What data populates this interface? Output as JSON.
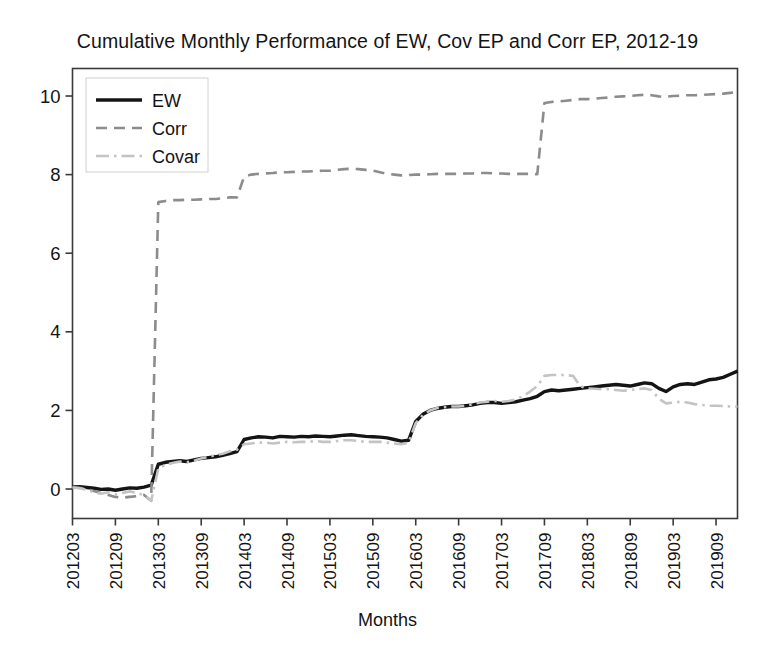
{
  "chart_data": {
    "type": "line",
    "title": "Cumulative Monthly Performance of EW, Cov EP and Corr EP, 2012-19",
    "xlabel": "Months",
    "ylabel": "",
    "grid": false,
    "legend_position": "top-left",
    "xlim": [
      0,
      93
    ],
    "ylim": [
      -0.75,
      10.7
    ],
    "yticks": [
      "0",
      "2",
      "4",
      "6",
      "8",
      "10"
    ],
    "ytick_values": [
      0,
      2,
      4,
      6,
      8,
      10
    ],
    "xticks": [
      "201203",
      "201209",
      "201303",
      "201309",
      "201403",
      "201409",
      "201503",
      "201509",
      "201603",
      "201609",
      "201703",
      "201709",
      "201803",
      "201809",
      "201903",
      "201909"
    ],
    "xtick_indices": [
      0,
      6,
      12,
      18,
      24,
      30,
      36,
      42,
      48,
      54,
      60,
      66,
      72,
      78,
      84,
      90
    ],
    "series": [
      {
        "name": "EW",
        "color": "#141414",
        "style": "solid",
        "values": [
          0.05,
          0.06,
          0.04,
          0.02,
          -0.01,
          0.0,
          -0.03,
          0.0,
          0.03,
          0.02,
          0.05,
          0.1,
          0.63,
          0.68,
          0.7,
          0.72,
          0.7,
          0.74,
          0.78,
          0.8,
          0.82,
          0.86,
          0.9,
          0.95,
          1.26,
          1.3,
          1.33,
          1.32,
          1.3,
          1.34,
          1.33,
          1.32,
          1.34,
          1.33,
          1.35,
          1.34,
          1.33,
          1.35,
          1.37,
          1.38,
          1.36,
          1.34,
          1.33,
          1.32,
          1.3,
          1.26,
          1.22,
          1.24,
          1.72,
          1.9,
          2.0,
          2.05,
          2.08,
          2.1,
          2.1,
          2.12,
          2.14,
          2.18,
          2.2,
          2.2,
          2.18,
          2.2,
          2.22,
          2.26,
          2.3,
          2.36,
          2.48,
          2.52,
          2.5,
          2.52,
          2.54,
          2.56,
          2.58,
          2.6,
          2.62,
          2.64,
          2.66,
          2.64,
          2.62,
          2.66,
          2.7,
          2.68,
          2.56,
          2.48,
          2.6,
          2.66,
          2.68,
          2.66,
          2.72,
          2.78,
          2.8,
          2.84,
          2.92,
          3.0
        ]
      },
      {
        "name": "Corr",
        "color": "#8c8c8c",
        "style": "dashed",
        "values": [
          0.05,
          0.03,
          0.0,
          -0.05,
          -0.1,
          -0.15,
          -0.2,
          -0.22,
          -0.2,
          -0.18,
          -0.15,
          -0.3,
          7.3,
          7.33,
          7.35,
          7.35,
          7.36,
          7.36,
          7.37,
          7.38,
          7.38,
          7.4,
          7.42,
          7.42,
          7.95,
          8.0,
          8.02,
          8.03,
          8.04,
          8.06,
          8.06,
          8.07,
          8.08,
          8.08,
          8.09,
          8.1,
          8.1,
          8.12,
          8.14,
          8.15,
          8.14,
          8.12,
          8.1,
          8.06,
          8.02,
          8.0,
          7.98,
          7.99,
          8.0,
          8.0,
          8.01,
          8.02,
          8.02,
          8.02,
          8.02,
          8.03,
          8.03,
          8.04,
          8.04,
          8.03,
          8.03,
          8.02,
          8.02,
          8.02,
          8.02,
          8.01,
          9.82,
          9.85,
          9.86,
          9.88,
          9.9,
          9.92,
          9.92,
          9.93,
          9.95,
          9.96,
          9.98,
          9.99,
          10.0,
          10.02,
          10.03,
          10.02,
          9.99,
          9.98,
          10.0,
          10.01,
          10.02,
          10.02,
          10.03,
          10.04,
          10.05,
          10.06,
          10.08,
          10.1
        ]
      },
      {
        "name": "Covar",
        "color": "#c4c4c4",
        "style": "dashdot",
        "values": [
          0.04,
          0.02,
          -0.02,
          -0.08,
          -0.12,
          -0.08,
          -0.14,
          -0.1,
          -0.06,
          -0.1,
          -0.16,
          -0.3,
          0.52,
          0.62,
          0.66,
          0.7,
          0.68,
          0.72,
          0.78,
          0.82,
          0.86,
          0.9,
          0.96,
          1.0,
          1.14,
          1.16,
          1.18,
          1.18,
          1.16,
          1.18,
          1.2,
          1.19,
          1.2,
          1.2,
          1.22,
          1.2,
          1.2,
          1.22,
          1.24,
          1.24,
          1.22,
          1.2,
          1.2,
          1.2,
          1.18,
          1.16,
          1.14,
          1.18,
          1.68,
          1.88,
          2.0,
          2.06,
          2.08,
          2.1,
          2.1,
          2.12,
          2.16,
          2.2,
          2.22,
          2.24,
          2.22,
          2.24,
          2.28,
          2.36,
          2.48,
          2.62,
          2.88,
          2.9,
          2.9,
          2.9,
          2.88,
          2.62,
          2.56,
          2.55,
          2.54,
          2.54,
          2.52,
          2.5,
          2.52,
          2.54,
          2.56,
          2.52,
          2.3,
          2.18,
          2.2,
          2.22,
          2.2,
          2.16,
          2.14,
          2.12,
          2.12,
          2.11,
          2.1,
          2.1
        ]
      }
    ]
  },
  "legend": {
    "entries": [
      "EW",
      "Corr",
      "Covar"
    ]
  }
}
